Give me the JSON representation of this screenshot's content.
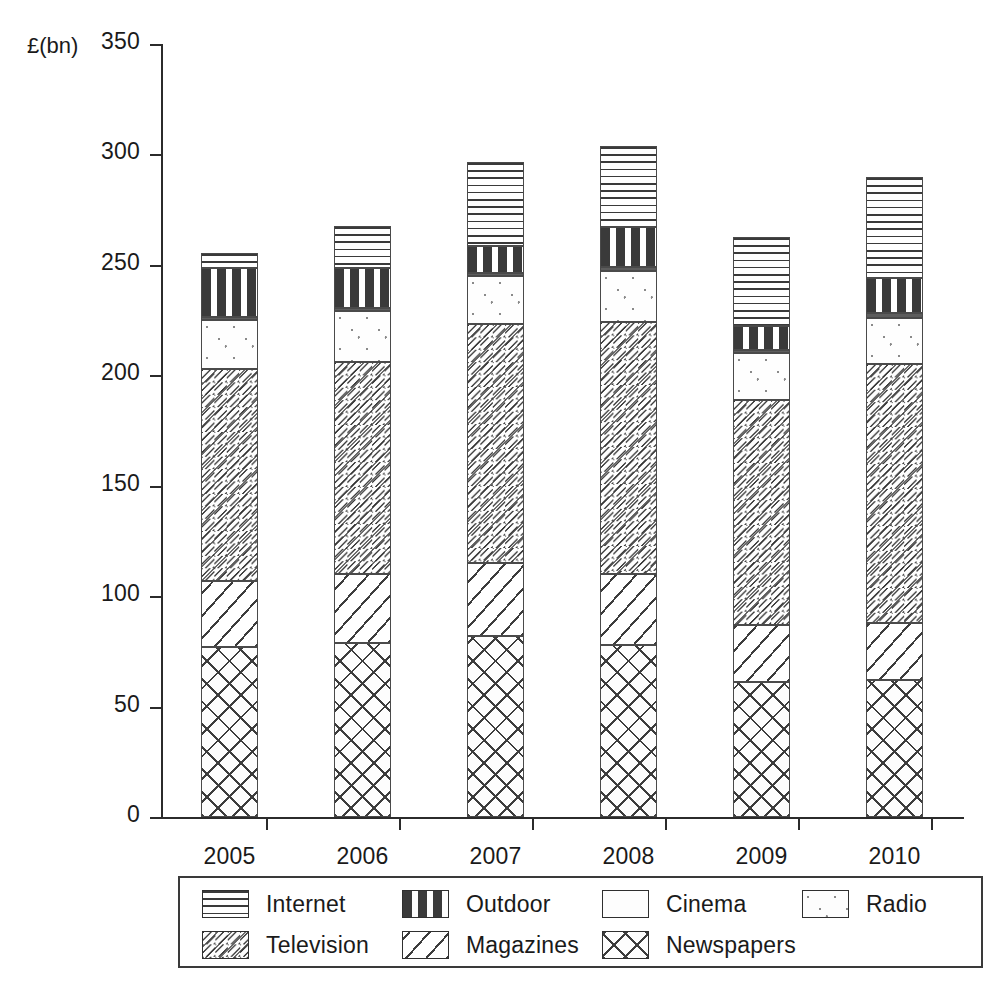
{
  "chart_data": {
    "type": "bar",
    "subtype": "stacked-bar",
    "title": "",
    "xlabel": "",
    "ylabel": "£(bn)",
    "y_unit_label": "£(bn)",
    "categories": [
      "2005",
      "2006",
      "2007",
      "2008",
      "2009",
      "2010"
    ],
    "ylim": [
      0,
      350
    ],
    "yticks": [
      0,
      50,
      100,
      150,
      200,
      250,
      300,
      350
    ],
    "ytick_labels": [
      "0",
      "50",
      "100",
      "150",
      "200",
      "250",
      "300",
      "350"
    ],
    "grid": false,
    "legend_position": "bottom",
    "stack_order_bottom_to_top": [
      "Newspapers",
      "Magazines",
      "Television",
      "Radio",
      "Cinema",
      "Outdoor",
      "Internet"
    ],
    "series": [
      {
        "name": "Newspapers",
        "pattern": "newspapers",
        "values": [
          77,
          79,
          82,
          78,
          61,
          62
        ]
      },
      {
        "name": "Magazines",
        "pattern": "magazines",
        "values": [
          30,
          31,
          33,
          32,
          26,
          26
        ]
      },
      {
        "name": "Television",
        "pattern": "television",
        "values": [
          96,
          96,
          108,
          114,
          102,
          117
        ]
      },
      {
        "name": "Radio",
        "pattern": "radio",
        "values": [
          22,
          23,
          22,
          23,
          21,
          21
        ]
      },
      {
        "name": "Cinema",
        "pattern": "cinema",
        "values": [
          1.5,
          1.5,
          1.5,
          2,
          1.5,
          2
        ]
      },
      {
        "name": "Outdoor",
        "pattern": "outdoor",
        "values": [
          22,
          18,
          12,
          18,
          11,
          16
        ]
      },
      {
        "name": "Internet",
        "pattern": "internet",
        "values": [
          7,
          19,
          38,
          37,
          40,
          46
        ]
      }
    ],
    "totals": [
      255.5,
      267.5,
      296.5,
      304,
      262.5,
      290
    ]
  },
  "legend": {
    "entries": [
      {
        "label": "Internet",
        "pattern": "internet"
      },
      {
        "label": "Outdoor",
        "pattern": "outdoor"
      },
      {
        "label": "Cinema",
        "pattern": "cinema"
      },
      {
        "label": "Radio",
        "pattern": "radio"
      },
      {
        "label": "Television",
        "pattern": "television"
      },
      {
        "label": "Magazines",
        "pattern": "magazines"
      },
      {
        "label": "Newspapers",
        "pattern": "newspapers"
      }
    ]
  },
  "colors": {
    "axis": "#2b2b2b",
    "text": "#1a1a1a",
    "cinema_fill": "#5d5d5d",
    "hatch": "#3d3d3d",
    "background": "#ffffff"
  }
}
